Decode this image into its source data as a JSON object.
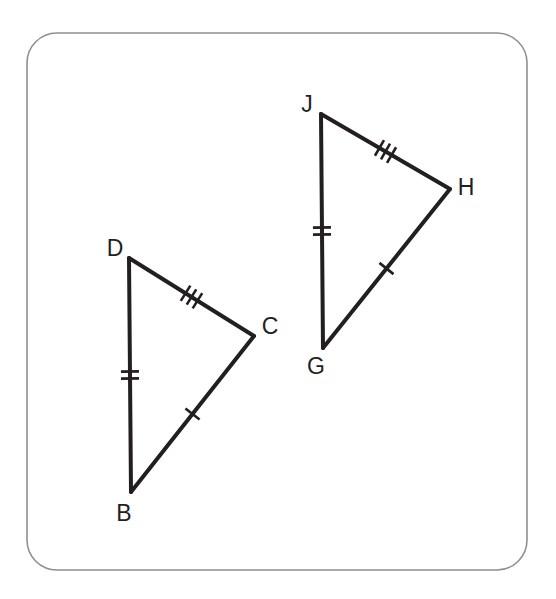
{
  "figure": {
    "background_color": "#ffffff",
    "frame": {
      "stroke_color": "#8f8f94",
      "corner_radius": 30
    },
    "line_color": "#231f20",
    "triangles": [
      {
        "name": "triangle-bcd",
        "vertices": [
          {
            "label": "D",
            "x": 129,
            "y": 258,
            "label_x": 115,
            "label_y": 256
          },
          {
            "label": "C",
            "x": 254,
            "y": 336,
            "label_x": 270,
            "label_y": 334
          },
          {
            "label": "B",
            "x": 131,
            "y": 492,
            "label_x": 124,
            "label_y": 521
          }
        ],
        "sides": [
          {
            "name": "side-DC",
            "from": "D",
            "to": "C",
            "ticks": 3
          },
          {
            "name": "side-CB",
            "from": "C",
            "to": "B",
            "ticks": 1
          },
          {
            "name": "side-BD",
            "from": "B",
            "to": "D",
            "ticks": 2
          }
        ]
      },
      {
        "name": "triangle-ghj",
        "vertices": [
          {
            "label": "J",
            "x": 321,
            "y": 114,
            "label_x": 307,
            "label_y": 112
          },
          {
            "label": "H",
            "x": 450,
            "y": 189,
            "label_x": 466,
            "label_y": 195
          },
          {
            "label": "G",
            "x": 323,
            "y": 348,
            "label_x": 316,
            "label_y": 374
          }
        ],
        "sides": [
          {
            "name": "side-JH",
            "from": "J",
            "to": "H",
            "ticks": 3
          },
          {
            "name": "side-HG",
            "from": "H",
            "to": "G",
            "ticks": 1
          },
          {
            "name": "side-GJ",
            "from": "G",
            "to": "J",
            "ticks": 2
          }
        ]
      }
    ],
    "labels": [
      "D",
      "C",
      "B",
      "J",
      "H",
      "G"
    ]
  }
}
